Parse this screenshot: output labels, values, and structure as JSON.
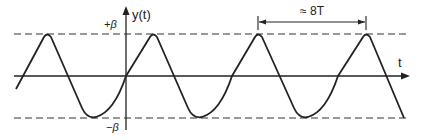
{
  "diagram": {
    "type": "waveform",
    "y_axis_label": "y(t)",
    "x_axis_label": "t",
    "upper_bound_label": "+β",
    "lower_bound_label": "−β",
    "period_annotation": "≈ 8T",
    "colors": {
      "line": "#222222",
      "background": "#ffffff"
    }
  }
}
